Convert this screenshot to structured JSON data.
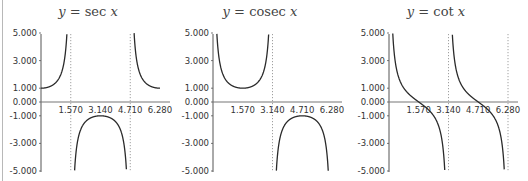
{
  "chart_data": [
    {
      "type": "line",
      "title": "y = sec x",
      "title_parts": {
        "lhs": "y",
        "eq": " = ",
        "fn": "sec ",
        "arg": "x"
      },
      "function": "sec",
      "xlabel": "",
      "ylabel": "",
      "xlim": [
        0,
        6.28
      ],
      "ylim": [
        -5,
        5
      ],
      "x_ticks": [
        "1.570",
        "3.140",
        "4.710",
        "6.280"
      ],
      "y_ticks": [
        "5.000",
        "3.000",
        "1.000",
        "0.000",
        "-1.000",
        "-3.000",
        "-5.000"
      ],
      "asymptotes": [
        1.57,
        4.71
      ],
      "grid": false,
      "sample_points": [
        [
          0,
          1.0
        ],
        [
          0.785,
          1.414
        ],
        [
          1.3,
          3.74
        ],
        [
          2.0,
          -2.4
        ],
        [
          3.14,
          -1.0
        ],
        [
          4.3,
          -2.47
        ],
        [
          5.5,
          1.41
        ],
        [
          6.28,
          1.0
        ]
      ]
    },
    {
      "type": "line",
      "title": "y = cosec x",
      "title_parts": {
        "lhs": "y",
        "eq": " = ",
        "fn": "cosec ",
        "arg": "x"
      },
      "function": "cosec",
      "xlabel": "",
      "ylabel": "",
      "xlim": [
        0,
        6.28
      ],
      "ylim": [
        -5,
        5
      ],
      "x_ticks": [
        "1.570",
        "3.140",
        "4.710",
        "6.280"
      ],
      "y_ticks": [
        "5.000",
        "3.000",
        "1.000",
        "0.000",
        "-1.000",
        "-3.000",
        "-5.000"
      ],
      "asymptotes": [
        3.14
      ],
      "grid": false,
      "sample_points": [
        [
          0.2,
          5.03
        ],
        [
          0.785,
          1.414
        ],
        [
          1.57,
          1.0
        ],
        [
          2.36,
          1.414
        ],
        [
          2.94,
          5.0
        ],
        [
          3.34,
          -5.0
        ],
        [
          4.71,
          -1.0
        ],
        [
          6.08,
          -5.0
        ]
      ]
    },
    {
      "type": "line",
      "title": "y = cot x",
      "title_parts": {
        "lhs": "y",
        "eq": " = ",
        "fn": "cot ",
        "arg": "x"
      },
      "function": "cot",
      "xlabel": "",
      "ylabel": "",
      "xlim": [
        0,
        6.28
      ],
      "ylim": [
        -5,
        5
      ],
      "x_ticks": [
        "1.570",
        "3.140",
        "4.710",
        "6.280"
      ],
      "y_ticks": [
        "5.000",
        "3.000",
        "1.000",
        "0.000",
        "-1.000",
        "-3.000",
        "-5.000"
      ],
      "asymptotes": [
        3.14,
        6.28
      ],
      "grid": false,
      "sample_points": [
        [
          0.2,
          4.93
        ],
        [
          0.785,
          1.0
        ],
        [
          1.57,
          0.0
        ],
        [
          2.36,
          -1.0
        ],
        [
          2.94,
          -4.93
        ],
        [
          3.34,
          4.93
        ],
        [
          4.71,
          0.0
        ],
        [
          6.08,
          -4.93
        ]
      ]
    }
  ]
}
